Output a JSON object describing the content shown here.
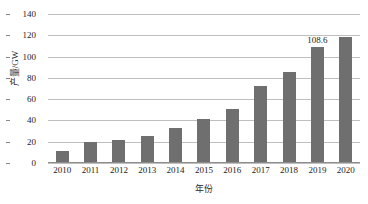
{
  "chart_data": {
    "type": "bar",
    "title": "",
    "xlabel": "年份",
    "ylabel": "产量/GW",
    "categories": [
      "2010",
      "2011",
      "2012",
      "2013",
      "2014",
      "2015",
      "2016",
      "2017",
      "2018",
      "2019",
      "2020"
    ],
    "values": [
      11,
      20,
      21.5,
      25.5,
      33,
      41,
      51,
      72.5,
      85.5,
      108.6,
      118
    ],
    "point_labels": [
      "",
      "",
      "",
      "",
      "",
      "",
      "",
      "",
      "",
      "108.6",
      ""
    ],
    "ylim": [
      0,
      140
    ],
    "yticks": [
      0,
      20,
      40,
      60,
      80,
      100,
      120,
      140
    ],
    "ytick_labels": [
      "0",
      "20",
      "40",
      "60",
      "80",
      "100",
      "120",
      "140"
    ],
    "grid": true,
    "legend": false,
    "legend_position": "none",
    "series": [
      {
        "name": "产量",
        "color": "#6f6f6f",
        "values": [
          11,
          20,
          21.5,
          25.5,
          33,
          41,
          51,
          72.5,
          85.5,
          108.6,
          118
        ]
      }
    ],
    "colors": {
      "bar": "#6f6f6f",
      "gridline": "#bfbfbf",
      "axis": "#8c8c8c",
      "text": "#1c1c1c",
      "background": "#ffffff"
    }
  }
}
